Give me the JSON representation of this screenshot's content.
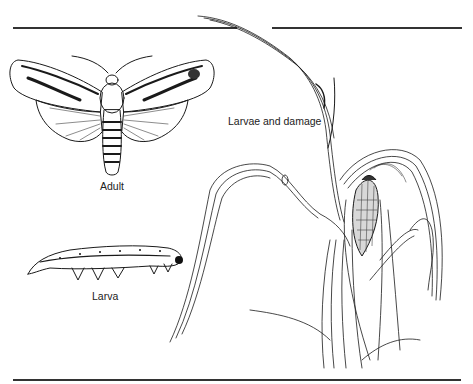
{
  "figure": {
    "labels": {
      "adult": "Adult",
      "larva": "Larva",
      "larvae_damage": "Larvae and damage"
    },
    "icons": [
      "moth-adult-illustration",
      "larva-illustration",
      "corn-plant-damage-illustration"
    ],
    "colors": {
      "ink": "#1a1a1a",
      "rule": "#333333",
      "background": "#ffffff"
    }
  }
}
